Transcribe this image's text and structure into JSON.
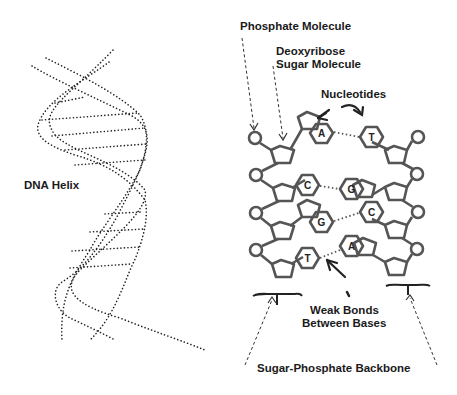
{
  "labels": {
    "dna_helix": "DNA Helix",
    "phosphate": "Phosphate Molecule",
    "deoxyribose_line1": "Deoxyribose",
    "deoxyribose_line2": "Sugar Molecule",
    "nucleotides": "Nucleotides",
    "weak_bonds_line1": "Weak Bonds",
    "weak_bonds_line2": "Between Bases",
    "backbone": "Sugar-Phosphate Backbone"
  },
  "base_pairs": [
    {
      "left": "A",
      "right": "T"
    },
    {
      "left": "C",
      "right": "G"
    },
    {
      "left": "G",
      "right": "C"
    },
    {
      "left": "T",
      "right": "A"
    }
  ],
  "colors": {
    "stroke": "#555555",
    "dots": "#222222",
    "text": "#1a1a1a"
  }
}
